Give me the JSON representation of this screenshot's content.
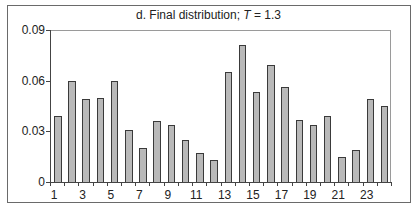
{
  "chart_data": {
    "type": "bar",
    "title": "d. Final distribution; T = 1.3",
    "title_parts": {
      "prefix": "d. Final distribution; ",
      "variable": "T",
      "suffix": " = 1.3"
    },
    "xlabel": "",
    "ylabel": "",
    "categories": [
      1,
      2,
      3,
      4,
      5,
      6,
      7,
      8,
      9,
      10,
      11,
      12,
      13,
      14,
      15,
      16,
      17,
      18,
      19,
      20,
      21,
      22,
      23,
      24
    ],
    "x_tick_labels": [
      "1",
      "3",
      "5",
      "7",
      "9",
      "11",
      "13",
      "15",
      "17",
      "19",
      "21",
      "23"
    ],
    "values": [
      0.039,
      0.06,
      0.049,
      0.05,
      0.06,
      0.031,
      0.02,
      0.036,
      0.034,
      0.025,
      0.017,
      0.013,
      0.065,
      0.081,
      0.053,
      0.069,
      0.056,
      0.037,
      0.034,
      0.039,
      0.015,
      0.019,
      0.049,
      0.045
    ],
    "ylim": [
      0,
      0.09
    ],
    "y_ticks": [
      0,
      0.03,
      0.06,
      0.09
    ],
    "y_tick_labels": [
      "0",
      "0.03",
      "0.06",
      "0.09"
    ],
    "grid": false,
    "legend": null,
    "bar_color": "#b9b9b9",
    "bar_edge_color": "#3a3a3a"
  }
}
